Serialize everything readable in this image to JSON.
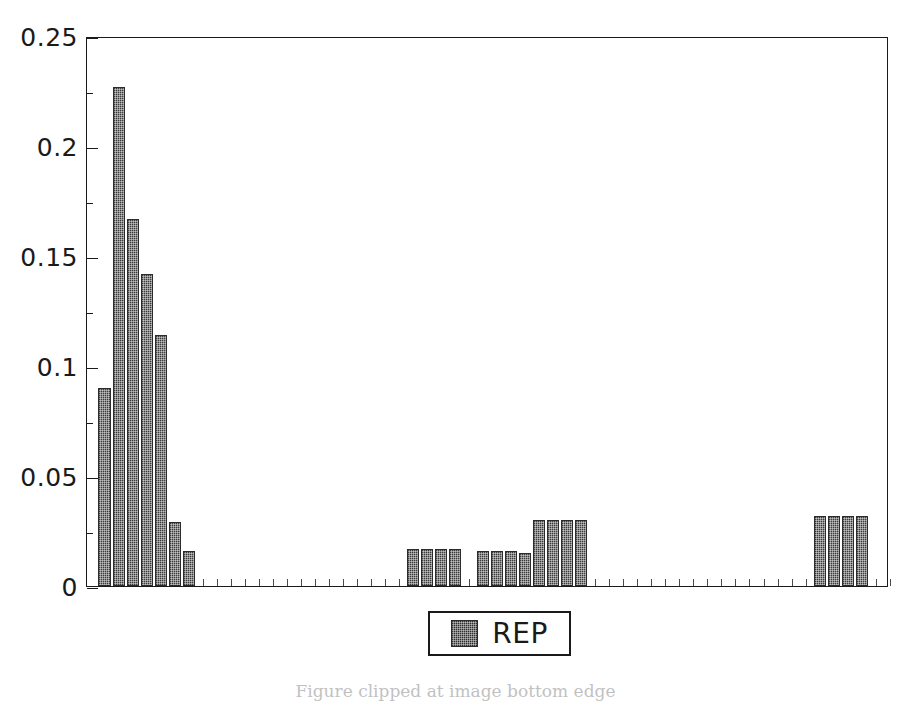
{
  "chart_data": {
    "type": "bar",
    "title": "",
    "subtitle": "",
    "xlabel": "",
    "ylabel": "",
    "ylim": [
      0,
      0.25
    ],
    "y_ticks": [
      "0",
      "0.05",
      "0.1",
      "0.15",
      "0.2",
      "0.25"
    ],
    "y_tick_values": [
      0,
      0.05,
      0.1,
      0.15,
      0.2,
      0.25
    ],
    "y_minor_tick_interval": 0.025,
    "x_tick_labels": [],
    "x_axis_visible_ticks": true,
    "grid": false,
    "legend_position": "below-axes-center",
    "series": [
      {
        "name": "REP",
        "color": "#3c3c3c",
        "slots": 56,
        "values": [
          0.09,
          0.227,
          0.167,
          0.142,
          0.114,
          0.029,
          0.016,
          0,
          0,
          0,
          0,
          0,
          0,
          0,
          0,
          0,
          0,
          0,
          0,
          0,
          0,
          0,
          0.017,
          0.017,
          0.017,
          0.017,
          0,
          0.016,
          0.016,
          0.016,
          0.015,
          0.03,
          0.03,
          0.03,
          0.03,
          0,
          0,
          0,
          0,
          0,
          0,
          0,
          0,
          0,
          0,
          0,
          0,
          0,
          0,
          0,
          0,
          0.032,
          0.032,
          0.032,
          0.032,
          0,
          0
        ]
      }
    ],
    "legend": [
      {
        "label": "REP",
        "swatch": "#3c3c3c"
      }
    ],
    "annotations": {
      "caption_partial": "Figure  clipped  at  image  bottom  edge"
    }
  },
  "legend": {
    "label": "REP"
  },
  "axes": {
    "y_labels": [
      "0.25",
      "0.2",
      "0.15",
      "0.1",
      "0.05",
      "0"
    ]
  }
}
